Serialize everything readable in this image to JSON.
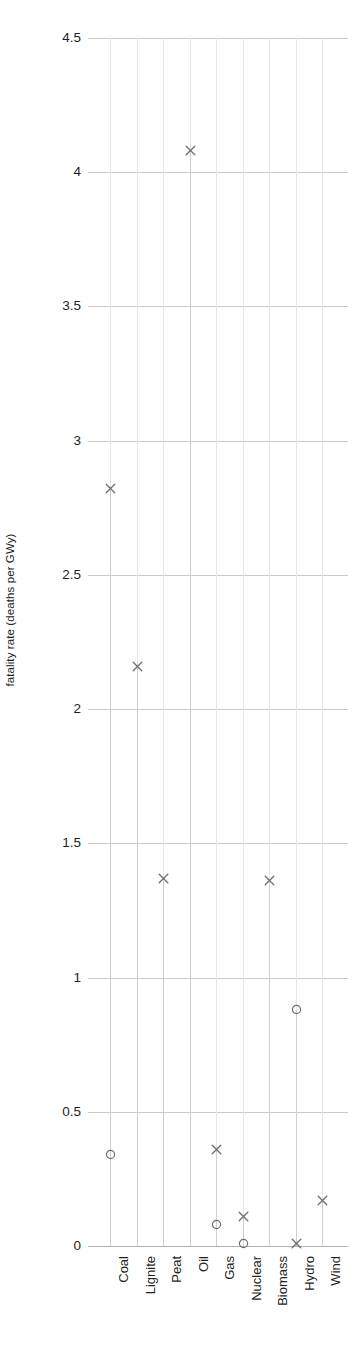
{
  "chart_data": {
    "type": "scatter",
    "title": "",
    "xlabel": "",
    "ylabel": "fatality rate (deaths per GWy)",
    "ylim": [
      0,
      4.5
    ],
    "yticks": [
      "0",
      "0.5",
      "1",
      "1.5",
      "2",
      "2.5",
      "3",
      "3.5",
      "4",
      "4.5"
    ],
    "ytick_values": [
      0,
      0.5,
      1,
      1.5,
      2,
      2.5,
      3,
      3.5,
      4,
      4.5
    ],
    "grid": "horizontal-and-vertical",
    "legend": "none",
    "categories": [
      "Coal",
      "Lignite",
      "Peat",
      "Oil",
      "Gas",
      "Nuclear",
      "Biomass",
      "Hydro",
      "Wind"
    ],
    "series": [
      {
        "name": "immediate fatalities",
        "marker": "cross",
        "values": [
          2.82,
          2.16,
          1.37,
          4.08,
          0.36,
          0.11,
          1.36,
          0.01,
          0.17
        ]
      },
      {
        "name": "latent fatalities",
        "marker": "circle",
        "values": [
          0.34,
          null,
          null,
          null,
          0.08,
          0.01,
          null,
          0.88,
          null
        ]
      }
    ],
    "points": [
      {
        "category": "Coal",
        "marker": "cross",
        "value": 2.82
      },
      {
        "category": "Coal",
        "marker": "circle",
        "value": 0.34
      },
      {
        "category": "Lignite",
        "marker": "cross",
        "value": 2.16
      },
      {
        "category": "Peat",
        "marker": "cross",
        "value": 1.37
      },
      {
        "category": "Oil",
        "marker": "cross",
        "value": 4.08
      },
      {
        "category": "Gas",
        "marker": "cross",
        "value": 0.36
      },
      {
        "category": "Gas",
        "marker": "circle",
        "value": 0.08
      },
      {
        "category": "Nuclear",
        "marker": "cross",
        "value": 0.11
      },
      {
        "category": "Nuclear",
        "marker": "circle",
        "value": 0.01
      },
      {
        "category": "Biomass",
        "marker": "cross",
        "value": 1.36
      },
      {
        "category": "Hydro",
        "marker": "circle",
        "value": 0.88
      },
      {
        "category": "Hydro",
        "marker": "cross",
        "value": 0.01
      },
      {
        "category": "Wind",
        "marker": "cross",
        "value": 0.17
      }
    ]
  },
  "caption": {
    "text": " "
  },
  "colors": {
    "marker": "#6e6e6e",
    "gridline": "#c9c9c9",
    "stem": "#cfcfcf",
    "text": "#231f20"
  }
}
